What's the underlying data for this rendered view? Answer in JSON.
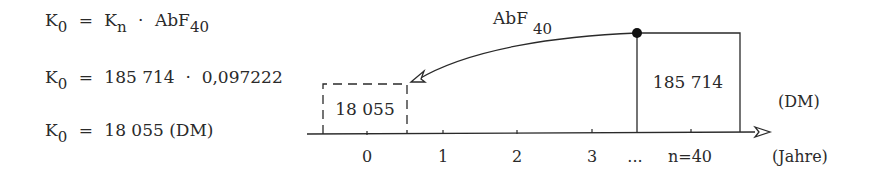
{
  "equations": [
    {
      "lhs": "K",
      "lhs_sub": "0",
      "eq": "=",
      "parts": [
        {
          "t": "K",
          "sub": "n"
        },
        {
          "t": "·"
        },
        {
          "t": "AbF",
          "sub": "40"
        }
      ]
    },
    {
      "lhs": "K",
      "lhs_sub": "0",
      "eq": "=",
      "rhs": "185 714  ·  0,097222"
    },
    {
      "lhs": "K",
      "lhs_sub": "0",
      "eq": "=",
      "rhs": "18 055 (DM)"
    }
  ],
  "diagram": {
    "arc_label": "AbF",
    "arc_label_sub": "40",
    "present_value_box": "18 055",
    "future_value_box": "185 714",
    "unit_label": "(DM)",
    "axis_label": "(Jahre)",
    "ticks": [
      "0",
      "1",
      "2",
      "3",
      "...",
      "n=40"
    ]
  },
  "colors": {
    "ink": "#2a2a2a",
    "background": "#ffffff"
  }
}
